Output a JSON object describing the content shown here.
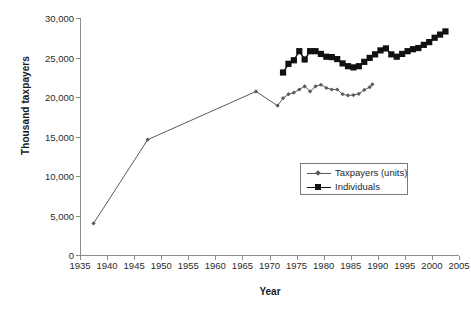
{
  "chart_data": {
    "type": "line",
    "title": "",
    "xlabel": "Year",
    "ylabel": "Thousand taxpayers",
    "xlim": [
      1935,
      2005
    ],
    "ylim": [
      0,
      30000
    ],
    "grid": false,
    "legend_position": "center-right",
    "xticks": [
      1935,
      1940,
      1945,
      1950,
      1955,
      1960,
      1965,
      1970,
      1975,
      1980,
      1985,
      1990,
      1995,
      2000,
      2005
    ],
    "xtick_labels": [
      "1935",
      "1940",
      "1945",
      "1950",
      "1955",
      "1960",
      "1965",
      "1970",
      "1975",
      "1980",
      "1985",
      "1990",
      "1995",
      "2000",
      "2005"
    ],
    "yticks": [
      0,
      5000,
      10000,
      15000,
      20000,
      25000,
      30000
    ],
    "ytick_labels": [
      "0",
      "5,000",
      "10,000",
      "15,000",
      "20,000",
      "25,000",
      "30,000"
    ],
    "series": [
      {
        "name": "Taxpayers (units)",
        "color": "#5a5a5a",
        "marker": "diamond",
        "points": [
          [
            1937.5,
            4000
          ],
          [
            1947.5,
            14600
          ],
          [
            1967.5,
            20700
          ],
          [
            1971.5,
            18900
          ],
          [
            1972.5,
            19850
          ],
          [
            1973.5,
            20350
          ],
          [
            1974.5,
            20550
          ],
          [
            1975.5,
            20950
          ],
          [
            1976.5,
            21350
          ],
          [
            1977.5,
            20700
          ],
          [
            1978.5,
            21350
          ],
          [
            1979.5,
            21550
          ],
          [
            1980.5,
            21150
          ],
          [
            1981.5,
            20950
          ],
          [
            1982.5,
            20950
          ],
          [
            1983.5,
            20350
          ],
          [
            1984.5,
            20200
          ],
          [
            1985.5,
            20250
          ],
          [
            1986.5,
            20400
          ],
          [
            1987.5,
            20900
          ],
          [
            1988.5,
            21250
          ],
          [
            1989.0,
            21600
          ]
        ]
      },
      {
        "name": "Individuals",
        "color": "#111111",
        "marker": "square",
        "points": [
          [
            1972.5,
            23100
          ],
          [
            1973.5,
            24200
          ],
          [
            1974.5,
            24650
          ],
          [
            1975.5,
            25800
          ],
          [
            1976.5,
            24750
          ],
          [
            1977.5,
            25800
          ],
          [
            1978.5,
            25800
          ],
          [
            1979.5,
            25450
          ],
          [
            1980.5,
            25100
          ],
          [
            1981.5,
            25050
          ],
          [
            1982.5,
            24800
          ],
          [
            1983.5,
            24250
          ],
          [
            1984.5,
            23900
          ],
          [
            1985.5,
            23750
          ],
          [
            1986.5,
            23900
          ],
          [
            1987.5,
            24450
          ],
          [
            1988.5,
            24950
          ],
          [
            1989.5,
            25400
          ],
          [
            1990.5,
            25900
          ],
          [
            1991.5,
            26150
          ],
          [
            1992.5,
            25400
          ],
          [
            1993.5,
            25100
          ],
          [
            1994.5,
            25450
          ],
          [
            1995.5,
            25800
          ],
          [
            1996.5,
            26050
          ],
          [
            1997.5,
            26200
          ],
          [
            1998.5,
            26600
          ],
          [
            1999.5,
            26950
          ],
          [
            2000.5,
            27500
          ],
          [
            2001.5,
            27900
          ],
          [
            2002.5,
            28300
          ]
        ]
      }
    ]
  },
  "legend": {
    "entries": [
      {
        "label": "Taxpayers (units)"
      },
      {
        "label": "Individuals"
      }
    ]
  },
  "axis": {
    "x_title": "Year",
    "y_title": "Thousand taxpayers"
  },
  "colors": {
    "taxpayers": "#5a5a5a",
    "individuals": "#111111",
    "axis": "#8c8c8c",
    "text": "#1f1f1f",
    "background": "#ffffff"
  }
}
